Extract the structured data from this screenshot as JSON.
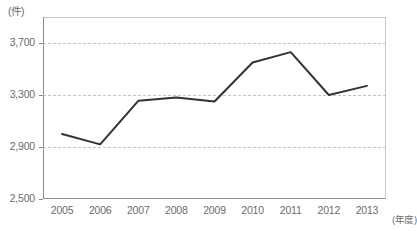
{
  "chart_data": {
    "type": "line",
    "title": "",
    "subtitle": "",
    "xlabel": "(年度)",
    "ylabel": "(件)",
    "categories": [
      "2005",
      "2006",
      "2007",
      "2008",
      "2009",
      "2010",
      "2011",
      "2012",
      "2013"
    ],
    "values": [
      3000,
      2920,
      3255,
      3280,
      3250,
      3550,
      3630,
      3300,
      3370
    ],
    "series": [
      {
        "name": "件数",
        "values": [
          3000,
          2920,
          3255,
          3280,
          3250,
          3550,
          3630,
          3300,
          3370
        ]
      }
    ],
    "ylim": [
      2500,
      3900
    ],
    "yticks": [
      2500,
      2900,
      3300,
      3700
    ],
    "ytick_labels": [
      "2,500",
      "2,900",
      "3,300",
      "3,700"
    ],
    "grid": true,
    "grid_axis": "y",
    "legend": false,
    "legend_position": "none",
    "line_color": "#333333",
    "grid_color": "#b9c4cf",
    "axis_color": "#8c8c8c",
    "annotations": []
  },
  "axes": {
    "y_unit_label": "(件)",
    "x_unit_label": "(年度)"
  }
}
